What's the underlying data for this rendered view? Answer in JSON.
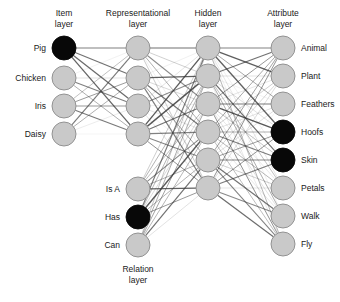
{
  "figure": {
    "background_color": "#ffffff",
    "node_fill_inactive": "#c9c9c9",
    "node_fill_active": "#080808",
    "node_stroke": "#8a8a8a",
    "edge_color": "#3a3a3a"
  },
  "headers": {
    "item": "Item\nlayer",
    "item_line1": "Item",
    "item_line2": "layer",
    "representational_line1": "Representational",
    "representational_line2": "layer",
    "hidden_line1": "Hidden",
    "hidden_line2": "layer",
    "attribute_line1": "Attribute",
    "attribute_line2": "layer",
    "relation_line1": "Relation",
    "relation_line2": "layer"
  },
  "layers": {
    "item": {
      "name": "Item layer",
      "x": 64,
      "radius": 12,
      "label_side": "left",
      "nodes": [
        {
          "label": "Pig",
          "y": 48,
          "state": "on"
        },
        {
          "label": "Chicken",
          "y": 78,
          "state": "off"
        },
        {
          "label": "Iris",
          "y": 106,
          "state": "off"
        },
        {
          "label": "Daisy",
          "y": 134,
          "state": "off"
        }
      ]
    },
    "representational": {
      "name": "Representational layer",
      "x": 138,
      "radius": 12,
      "label_side": "none",
      "nodes": [
        {
          "label": "R1",
          "y": 48,
          "state": "off"
        },
        {
          "label": "R2",
          "y": 78,
          "state": "off"
        },
        {
          "label": "R3",
          "y": 106,
          "state": "off"
        },
        {
          "label": "R4",
          "y": 134,
          "state": "off"
        }
      ]
    },
    "relation": {
      "name": "Relation layer",
      "x": 138,
      "radius": 12,
      "label_side": "left",
      "nodes": [
        {
          "label": "Is A",
          "y": 189,
          "state": "off"
        },
        {
          "label": "Has",
          "y": 217,
          "state": "on"
        },
        {
          "label": "Can",
          "y": 245,
          "state": "off"
        }
      ]
    },
    "hidden": {
      "name": "Hidden layer",
      "x": 208,
      "radius": 12,
      "label_side": "none",
      "nodes": [
        {
          "label": "H1",
          "y": 48,
          "state": "off"
        },
        {
          "label": "H2",
          "y": 76,
          "state": "off"
        },
        {
          "label": "H3",
          "y": 104,
          "state": "off"
        },
        {
          "label": "H4",
          "y": 132,
          "state": "off"
        },
        {
          "label": "H5",
          "y": 160,
          "state": "off"
        },
        {
          "label": "H6",
          "y": 188,
          "state": "off"
        }
      ]
    },
    "attribute": {
      "name": "Attribute layer",
      "x": 283,
      "radius": 12,
      "label_side": "right",
      "nodes": [
        {
          "label": "Animal",
          "y": 48,
          "state": "off"
        },
        {
          "label": "Plant",
          "y": 76,
          "state": "off"
        },
        {
          "label": "Feathers",
          "y": 104,
          "state": "off"
        },
        {
          "label": "Hoofs",
          "y": 132,
          "state": "on"
        },
        {
          "label": "Skin",
          "y": 160,
          "state": "on"
        },
        {
          "label": "Petals",
          "y": 188,
          "state": "off"
        },
        {
          "label": "Walk",
          "y": 216,
          "state": "off"
        },
        {
          "label": "Fly",
          "y": 244,
          "state": "off"
        }
      ]
    }
  },
  "header_positions": {
    "item_x": 64,
    "representational_x": 138,
    "hidden_x": 208,
    "attribute_x": 283,
    "line1_y": 16,
    "line2_y": 27,
    "relation_x": 138,
    "relation_line1_y": 272,
    "relation_line2_y": 283
  },
  "connections": {
    "item_to_representational": "full",
    "representational_to_hidden": "full",
    "relation_to_hidden": "full",
    "hidden_to_attribute": "full"
  }
}
